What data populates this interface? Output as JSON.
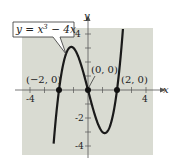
{
  "chart_data": {
    "type": "line",
    "title": "",
    "equation_label": "y = x^3 − 4x",
    "equation_parts": {
      "lhs": "y = x",
      "exp": "3",
      "rhs": " − 4x"
    },
    "xlabel": "x",
    "ylabel": "y",
    "xlim": [
      -4.5,
      4.5
    ],
    "ylim": [
      -4.5,
      4.5
    ],
    "x_ticks": [
      -4,
      -3,
      -2,
      -1,
      1,
      2,
      3,
      4
    ],
    "x_tick_labels": {
      "-4": "-4",
      "4": "4"
    },
    "y_ticks": [
      -4,
      -3,
      -2,
      -1,
      1,
      2,
      3,
      4
    ],
    "y_tick_labels": {
      "4": "4",
      "-2": "-2",
      "-4": "-4"
    },
    "grid": false,
    "series": [
      {
        "name": "y = x^3 - 4x",
        "function": "x^3 - 4x",
        "color": "#1a1a1a"
      }
    ],
    "points": [
      {
        "x": -2,
        "y": 0,
        "label": "(−2, 0)"
      },
      {
        "x": 0,
        "y": 0,
        "label": "(0, 0)"
      },
      {
        "x": 2,
        "y": 0,
        "label": "(2, 0)"
      }
    ],
    "colors": {
      "plot_bg": "#d9dbd2",
      "curve": "#1a1a1a",
      "axis": "#555555"
    }
  }
}
